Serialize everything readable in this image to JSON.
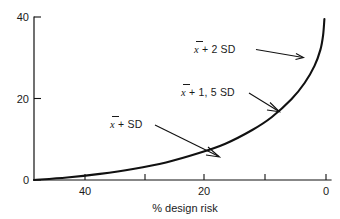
{
  "chart_data": {
    "type": "line",
    "title": "",
    "subtitle": "",
    "xlabel": "% design risk",
    "ylabel": "",
    "xlim": [
      45,
      0
    ],
    "ylim": [
      0,
      40
    ],
    "x_reversed": true,
    "grid": false,
    "legend": "none",
    "x_ticks": [
      40,
      30,
      20,
      10,
      0
    ],
    "x_tick_labels": [
      "40",
      "",
      "20",
      "",
      "0"
    ],
    "y_ticks": [
      0,
      20,
      40
    ],
    "y_tick_labels": [
      "0",
      "20",
      "40"
    ],
    "series": [
      {
        "name": "design factor vs % design risk",
        "x": [
          45,
          40,
          35,
          30,
          25,
          20,
          16,
          12,
          9,
          6,
          4,
          2.5,
          1.6,
          1.2,
          1.0
        ],
        "y": [
          0.0,
          0.6,
          1.5,
          2.7,
          4.3,
          6.6,
          8.9,
          12.2,
          15.4,
          19.8,
          23.8,
          28.0,
          32.0,
          35.5,
          39.5
        ]
      }
    ],
    "annotations": [
      {
        "id": "annot-2sd",
        "text_plain": "x̄ + 2 SD",
        "prefix": "x",
        "suffix": " + 2 SD",
        "text_x": 194,
        "text_y": 53,
        "leader_from": [
          256,
          49
        ],
        "leader_to": [
          303,
          57
        ]
      },
      {
        "id": "annot-15sd",
        "text_plain": "x̄ + 1, 5 SD",
        "prefix": "x",
        "suffix": " + 1, 5 SD",
        "text_x": 181,
        "text_y": 96,
        "leader_from": [
          249,
          93
        ],
        "leader_to": [
          279,
          111
        ]
      },
      {
        "id": "annot-1sd",
        "text_plain": "x̄ + SD",
        "prefix": "x",
        "suffix": " + SD",
        "text_x": 110,
        "text_y": 128,
        "leader_from": [
          155,
          125
        ],
        "leader_to": [
          218,
          156
        ]
      }
    ],
    "colors": {
      "curve": "#111111",
      "axis": "#111111",
      "text": "#1a1a1a",
      "background": "#ffffff"
    }
  },
  "axes": {
    "y_tick_40": "40",
    "y_tick_20": "20",
    "y_tick_0": "0",
    "x_tick_40": "40",
    "x_tick_20": "20",
    "x_tick_0": "0",
    "x_axis_title": "% design risk"
  },
  "annotations": {
    "a1_var": "x",
    "a1_rest": " + 2 SD",
    "a2_var": "x",
    "a2_rest": " + 1, 5 SD",
    "a3_var": "x",
    "a3_rest": " + SD"
  }
}
